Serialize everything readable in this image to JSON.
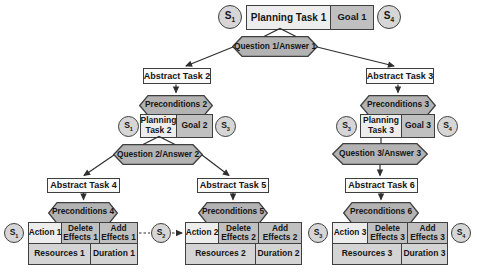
{
  "colors": {
    "background": "#ffffff",
    "border": "#3f3f3f",
    "hexagon_fill": "#b3b3b3",
    "task_fill": "#ededed",
    "goal_effects_fill": "#c0c0c0",
    "resources_fill": "#d4d4d4",
    "abstract_fill": "#fafafa",
    "state_circle_fill": "#d6d6d6",
    "line_color": "#2f2f2f"
  },
  "root": {
    "state_left": {
      "base": "S",
      "sub": "1"
    },
    "task": "Planning Task 1",
    "goal": "Goal 1",
    "state_right": {
      "base": "S",
      "sub": "4"
    },
    "question": "Question 1/Answer 1"
  },
  "branch_left": {
    "abstract": "Abstract Task 2",
    "preconditions": "Preconditions 2",
    "state_left": {
      "base": "S",
      "sub": "1"
    },
    "task": "Planning\nTask 2",
    "goal": "Goal 2",
    "state_right": {
      "base": "S",
      "sub": "3"
    },
    "question": "Question 2/Answer 2"
  },
  "branch_right": {
    "abstract": "Abstract Task 3",
    "preconditions": "Preconditions 3",
    "state_left": {
      "base": "S",
      "sub": "3"
    },
    "task": "Planning\nTask 3",
    "goal": "Goal 3",
    "state_right": {
      "base": "S",
      "sub": "4"
    },
    "question": "Question 3/Answer 3"
  },
  "leaves": [
    {
      "abstract": "Abstract Task 4",
      "preconditions": "Preconditions 4",
      "action": "Action 1",
      "delete_effects": "Delete\nEffects 1",
      "add_effects": "Add\nEffects 1",
      "resources": "Resources 1",
      "duration": "Duration 1"
    },
    {
      "abstract": "Abstract Task 5",
      "preconditions": "Preconditions 5",
      "action": "Action 2",
      "delete_effects": "Delete\nEffects 2",
      "add_effects": "Add\nEffects 2",
      "resources": "Resources 2",
      "duration": "Duration 2"
    },
    {
      "abstract": "Abstract Task 6",
      "preconditions": "Preconditions 6",
      "action": "Action 3",
      "delete_effects": "Delete\nEffects 3",
      "add_effects": "Add\nEffects 3",
      "resources": "Resources 3",
      "duration": "Duration 3"
    }
  ],
  "bottom_states": [
    {
      "base": "S",
      "sub": "1"
    },
    {
      "base": "S",
      "sub": "2"
    },
    {
      "base": "S",
      "sub": "3"
    },
    {
      "base": "S",
      "sub": "4"
    }
  ]
}
